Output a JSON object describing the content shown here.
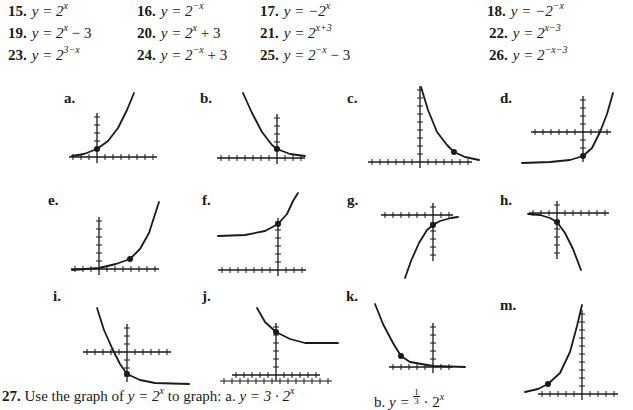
{
  "problems": [
    {
      "num": "15.",
      "lhs": "y = 2",
      "exp": "x",
      "tail": ""
    },
    {
      "num": "16.",
      "lhs": "y = 2",
      "exp": "−x",
      "tail": ""
    },
    {
      "num": "17.",
      "lhs": "y = −2",
      "exp": "x",
      "tail": ""
    },
    {
      "num": "18.",
      "lhs": "y = −2",
      "exp": "−x",
      "tail": ""
    },
    {
      "num": "19.",
      "lhs": "y = 2",
      "exp": "x",
      "tail": " − 3"
    },
    {
      "num": "20.",
      "lhs": "y = 2",
      "exp": "x",
      "tail": " + 3"
    },
    {
      "num": "21.",
      "lhs": "y = 2",
      "exp": "x+3",
      "tail": ""
    },
    {
      "num": "22.",
      "lhs": "y = 2",
      "exp": "x−3",
      "tail": ""
    },
    {
      "num": "23.",
      "lhs": "y = 2",
      "exp": "3−x",
      "tail": ""
    },
    {
      "num": "24.",
      "lhs": "y = 2",
      "exp": "−x",
      "tail": " + 3"
    },
    {
      "num": "25.",
      "lhs": "y = 2",
      "exp": "−x",
      "tail": " − 3"
    },
    {
      "num": "26.",
      "lhs": "y = 2",
      "exp": "−x−3",
      "tail": ""
    }
  ],
  "graph_labels": [
    "a.",
    "b.",
    "c.",
    "d.",
    "e.",
    "f.",
    "g.",
    "h.",
    "i.",
    "j.",
    "k.",
    "m."
  ],
  "footer": {
    "num": "27.",
    "text_before": " Use the graph of ",
    "base_eq": "y = 2",
    "base_exp": "x",
    "text_mid": " to graph:  a. ",
    "a_eq": "y = 3 · 2",
    "a_exp": "x",
    "b_label": "b. ",
    "b_eq_lhs": "y = ",
    "b_frac_num": "1",
    "b_frac_den": "3",
    "b_eq_rhs": " · 2",
    "b_exp": "x"
  },
  "graphs": [
    {
      "label": "a.",
      "ox": 97,
      "oy": 157,
      "xt": [
        -3,
        7
      ],
      "yt": [
        0,
        5
      ],
      "pts": "72,156 84,154 97,149 108,141 118,128 127,110 134,93",
      "dot": [
        97,
        149
      ]
    },
    {
      "label": "b.",
      "ox": 277,
      "oy": 158,
      "xt": [
        -7,
        3
      ],
      "yt": [
        0,
        5
      ],
      "pts": "243,93 252,113 262,132 272,145 277,149 290,154 305,156",
      "dot": [
        277,
        149
      ]
    },
    {
      "label": "c.",
      "ox": 420,
      "oy": 162,
      "xt": [
        -6,
        6
      ],
      "yt": [
        0,
        9
      ],
      "pts": "421,87 428,110 437,132 447,145 454,152 465,157 479,160",
      "dot": [
        454,
        152
      ]
    },
    {
      "label": "d.",
      "ox": 583,
      "oy": 132,
      "xt": [
        -6,
        3
      ],
      "yt": [
        -3,
        4
      ],
      "pts": "522,163 550,162 570,160 583,156 592,148 600,132 607,114 613,93",
      "dot": [
        583,
        156
      ]
    },
    {
      "label": "e.",
      "ox": 99,
      "oy": 269,
      "xt": [
        -3,
        7
      ],
      "yt": [
        0,
        6
      ],
      "pts": "72,270 99,268 116,264 130,259 140,249 149,233 159,202",
      "dot": [
        130,
        259
      ]
    },
    {
      "label": "f.",
      "ox": 278,
      "oy": 270,
      "xt": [
        -7,
        3
      ],
      "yt": [
        0,
        6
      ],
      "pts": "218,236 245,235 265,231 278,224 287,214 293,201 298,193",
      "dot": [
        278,
        224
      ]
    },
    {
      "label": "g.",
      "ox": 433,
      "oy": 215,
      "xt": [
        -6,
        2
      ],
      "yt": [
        -5,
        1
      ],
      "pts": "405,278 411,261 419,243 427,230 433,225 440,221 451,218 458,217",
      "dot": [
        433,
        225
      ]
    },
    {
      "label": "h.",
      "ox": 557,
      "oy": 213,
      "xt": [
        -3,
        6
      ],
      "yt": [
        -5,
        1
      ],
      "pts": "528,214 540,215 550,218 557,222 565,233 573,249 581,270",
      "dot": [
        557,
        222
      ]
    },
    {
      "label": "i.",
      "ox": 127,
      "oy": 352,
      "xt": [
        -5,
        5
      ],
      "yt": [
        -3,
        3
      ],
      "pts": "97,308 104,330 112,348 120,364 127,374 140,380 155,383 189,384",
      "dot": [
        127,
        374
      ]
    },
    {
      "label": "j.",
      "ox": 276,
      "oy": 375,
      "xt": [
        -5,
        5
      ],
      "yt": [
        0,
        6
      ],
      "pts": "257,308 265,322 276,332 290,339 305,343 338,343",
      "dot": [
        276,
        332
      ]
    },
    {
      "label": "k.",
      "ox": 433,
      "oy": 367,
      "xt": [
        -5,
        2
      ],
      "yt": [
        0,
        5
      ],
      "pts": "375,304 383,324 393,343 401,356 410,362 433,366 465,367",
      "dot": [
        401,
        356
      ]
    },
    {
      "label": "m.",
      "ox": 582,
      "oy": 394,
      "xt": [
        -5,
        4
      ],
      "yt": [
        0,
        10
      ],
      "pts": "525,392 538,389 548,384 560,373 570,352 577,326 582,305",
      "dot": [
        548,
        384
      ]
    }
  ],
  "colors": {
    "ink": "#1a1a1a",
    "paper": "#ffffff"
  }
}
